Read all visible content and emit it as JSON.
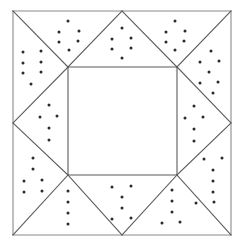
{
  "figure": {
    "type": "line-drawing",
    "canvas": {
      "width": 245,
      "height": 247
    },
    "colors": {
      "background": "#ffffff",
      "stroke": "#5a5a5a",
      "stroke_outer": "#8a8a8a",
      "dot": "#2b2b2b"
    },
    "stroke_width": 1.1,
    "dot_radius": 1.5,
    "outer_square": {
      "left": 13,
      "top": 11,
      "right": 231,
      "bottom": 235
    },
    "inner_square": {
      "left": 68,
      "top": 67,
      "right": 177,
      "bottom": 175
    },
    "edge_midpoints": {
      "top_x": 122,
      "bottom_x": 122,
      "left_y": 123,
      "right_y": 123
    },
    "lines": [
      {
        "name": "outer-top",
        "x1": 13,
        "y1": 11,
        "x2": 231,
        "y2": 11
      },
      {
        "name": "outer-right",
        "x1": 231,
        "y1": 11,
        "x2": 231,
        "y2": 235
      },
      {
        "name": "outer-bottom",
        "x1": 231,
        "y1": 235,
        "x2": 13,
        "y2": 235
      },
      {
        "name": "outer-left",
        "x1": 13,
        "y1": 235,
        "x2": 13,
        "y2": 11
      },
      {
        "name": "inner-top",
        "x1": 68,
        "y1": 67,
        "x2": 177,
        "y2": 67
      },
      {
        "name": "inner-right",
        "x1": 177,
        "y1": 67,
        "x2": 177,
        "y2": 175
      },
      {
        "name": "inner-bottom",
        "x1": 177,
        "y1": 175,
        "x2": 68,
        "y2": 175
      },
      {
        "name": "inner-left",
        "x1": 68,
        "y1": 175,
        "x2": 68,
        "y2": 67
      },
      {
        "name": "diag-tl-corner",
        "x1": 68,
        "y1": 67,
        "x2": 13,
        "y2": 11
      },
      {
        "name": "diag-tr-corner",
        "x1": 177,
        "y1": 67,
        "x2": 231,
        "y2": 11
      },
      {
        "name": "diag-br-corner",
        "x1": 177,
        "y1": 175,
        "x2": 231,
        "y2": 235
      },
      {
        "name": "diag-bl-corner",
        "x1": 68,
        "y1": 175,
        "x2": 13,
        "y2": 235
      },
      {
        "name": "ray-tl-to-topmid",
        "x1": 68,
        "y1": 67,
        "x2": 122,
        "y2": 11
      },
      {
        "name": "ray-tr-to-topmid",
        "x1": 177,
        "y1": 67,
        "x2": 122,
        "y2": 11
      },
      {
        "name": "ray-tl-to-leftmid",
        "x1": 68,
        "y1": 67,
        "x2": 13,
        "y2": 123
      },
      {
        "name": "ray-bl-to-leftmid",
        "x1": 68,
        "y1": 175,
        "x2": 13,
        "y2": 123
      },
      {
        "name": "ray-tr-to-rightmid",
        "x1": 177,
        "y1": 67,
        "x2": 231,
        "y2": 123
      },
      {
        "name": "ray-br-to-rightmid",
        "x1": 177,
        "y1": 175,
        "x2": 231,
        "y2": 123
      },
      {
        "name": "ray-bl-to-botmid",
        "x1": 68,
        "y1": 175,
        "x2": 122,
        "y2": 235
      },
      {
        "name": "ray-br-to-botmid",
        "x1": 177,
        "y1": 175,
        "x2": 122,
        "y2": 235
      }
    ],
    "dot_clusters": [
      {
        "name": "cluster-top-left-inner-triangle",
        "region": "triangle between inner-square top-left corner and top edge midpoint",
        "count": 6,
        "dots": [
          {
            "x": 68,
            "y": 21
          },
          {
            "x": 59,
            "y": 32
          },
          {
            "x": 79,
            "y": 31
          },
          {
            "x": 59,
            "y": 42
          },
          {
            "x": 78,
            "y": 41
          },
          {
            "x": 69,
            "y": 50
          }
        ]
      },
      {
        "name": "cluster-top-center-triangle",
        "region": "triangle above inner square apex at top edge midpoint",
        "count": 6,
        "dots": [
          {
            "x": 122,
            "y": 28
          },
          {
            "x": 112,
            "y": 39
          },
          {
            "x": 131,
            "y": 38
          },
          {
            "x": 112,
            "y": 49
          },
          {
            "x": 131,
            "y": 48
          },
          {
            "x": 122,
            "y": 58
          }
        ]
      },
      {
        "name": "cluster-top-right-inner-triangle",
        "region": "triangle between top edge midpoint and inner-square top-right corner",
        "count": 6,
        "dots": [
          {
            "x": 175,
            "y": 21
          },
          {
            "x": 166,
            "y": 32
          },
          {
            "x": 185,
            "y": 31
          },
          {
            "x": 166,
            "y": 42
          },
          {
            "x": 184,
            "y": 41
          },
          {
            "x": 175,
            "y": 50
          }
        ]
      },
      {
        "name": "cluster-left-upper-triangle",
        "region": "triangle between outer top-left corner and left edge midpoint",
        "count": 7,
        "dots": [
          {
            "x": 23,
            "y": 52
          },
          {
            "x": 41,
            "y": 51
          },
          {
            "x": 23,
            "y": 63
          },
          {
            "x": 41,
            "y": 62
          },
          {
            "x": 23,
            "y": 73
          },
          {
            "x": 41,
            "y": 72
          },
          {
            "x": 31,
            "y": 84
          }
        ]
      },
      {
        "name": "cluster-right-upper-triangle",
        "region": "triangle between top-right outer corner and right edge midpoint",
        "count": 7,
        "dots": [
          {
            "x": 211,
            "y": 51
          },
          {
            "x": 200,
            "y": 62
          },
          {
            "x": 219,
            "y": 61
          },
          {
            "x": 209,
            "y": 72
          },
          {
            "x": 200,
            "y": 83
          },
          {
            "x": 218,
            "y": 82
          },
          {
            "x": 213,
            "y": 93
          }
        ]
      },
      {
        "name": "cluster-left-center-diamond",
        "region": "triangle pointing left at left edge midpoint",
        "count": 5,
        "dots": [
          {
            "x": 49,
            "y": 105
          },
          {
            "x": 40,
            "y": 117
          },
          {
            "x": 57,
            "y": 116
          },
          {
            "x": 49,
            "y": 128
          },
          {
            "x": 49,
            "y": 140
          }
        ]
      },
      {
        "name": "cluster-right-center-diamond",
        "region": "triangle pointing right at right edge midpoint",
        "count": 5,
        "dots": [
          {
            "x": 194,
            "y": 106
          },
          {
            "x": 185,
            "y": 118
          },
          {
            "x": 203,
            "y": 117
          },
          {
            "x": 194,
            "y": 129
          },
          {
            "x": 194,
            "y": 141
          }
        ]
      },
      {
        "name": "cluster-left-lower-triangle",
        "region": "triangle between left edge midpoint and outer bottom-left corner",
        "count": 6,
        "dots": [
          {
            "x": 33,
            "y": 158
          },
          {
            "x": 33,
            "y": 169
          },
          {
            "x": 24,
            "y": 181
          },
          {
            "x": 42,
            "y": 180
          },
          {
            "x": 24,
            "y": 192
          },
          {
            "x": 42,
            "y": 191
          }
        ]
      },
      {
        "name": "cluster-right-lower-triangle",
        "region": "triangle between right edge midpoint and outer bottom-right corner",
        "count": 7,
        "dots": [
          {
            "x": 204,
            "y": 159
          },
          {
            "x": 222,
            "y": 158
          },
          {
            "x": 213,
            "y": 170
          },
          {
            "x": 213,
            "y": 181
          },
          {
            "x": 213,
            "y": 192
          },
          {
            "x": 196,
            "y": 203
          },
          {
            "x": 214,
            "y": 202
          }
        ]
      },
      {
        "name": "cluster-bottom-left-inner-triangle",
        "region": "triangle between inner-square bottom-left corner and bottom edge midpoint",
        "count": 4,
        "dots": [
          {
            "x": 68,
            "y": 191
          },
          {
            "x": 68,
            "y": 202
          },
          {
            "x": 68,
            "y": 213
          },
          {
            "x": 68,
            "y": 224
          }
        ]
      },
      {
        "name": "cluster-bottom-center-triangle",
        "region": "triangle below inner square with apex at bottom edge midpoint",
        "count": 6,
        "dots": [
          {
            "x": 112,
            "y": 187
          },
          {
            "x": 131,
            "y": 186
          },
          {
            "x": 122,
            "y": 197
          },
          {
            "x": 122,
            "y": 208
          },
          {
            "x": 112,
            "y": 219
          },
          {
            "x": 131,
            "y": 218
          }
        ]
      },
      {
        "name": "cluster-bottom-right-inner-triangle",
        "region": "triangle between bottom edge midpoint and inner-square bottom-right corner",
        "count": 5,
        "dots": [
          {
            "x": 172,
            "y": 190
          },
          {
            "x": 172,
            "y": 201
          },
          {
            "x": 172,
            "y": 212
          },
          {
            "x": 162,
            "y": 223
          },
          {
            "x": 180,
            "y": 222
          }
        ]
      }
    ]
  }
}
